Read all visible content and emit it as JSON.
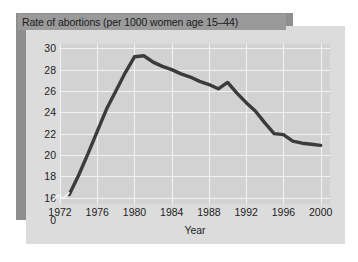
{
  "chart_data": {
    "type": "line",
    "title": "Rate of abortions (per 1000 women age 15–44)",
    "xlabel": "Year",
    "ylabel": "",
    "xlim": [
      1972,
      2001
    ],
    "ylim": [
      15.4,
      30.4
    ],
    "grid": true,
    "legend": false,
    "axis_break": true,
    "xticks": [
      1972,
      1976,
      1980,
      1984,
      1988,
      1992,
      1996,
      2000
    ],
    "xtick_labels": [
      "1972",
      "1976",
      "1980",
      "1984",
      "1988",
      "1992",
      "1996",
      "2000"
    ],
    "yticks": [
      16,
      18,
      20,
      22,
      24,
      26,
      28,
      30
    ],
    "ytick_labels": [
      "16",
      "18",
      "20",
      "22",
      "24",
      "26",
      "28",
      "30"
    ],
    "y_axis_origin_label": "0",
    "series": [
      {
        "name": "Rate of abortions",
        "color": "#3b3b3b",
        "x": [
          1973,
          1974,
          1975,
          1976,
          1977,
          1978,
          1979,
          1980,
          1981,
          1982,
          1983,
          1984,
          1985,
          1986,
          1987,
          1988,
          1989,
          1990,
          1991,
          1992,
          1993,
          1994,
          1995,
          1996,
          1997,
          1998,
          1999,
          2000
        ],
        "values": [
          16.3,
          18.1,
          20.1,
          22.2,
          24.3,
          26.0,
          27.7,
          29.2,
          29.3,
          28.7,
          28.3,
          28.0,
          27.6,
          27.3,
          26.9,
          26.6,
          26.2,
          26.8,
          25.8,
          24.9,
          24.1,
          23.0,
          22.0,
          21.9,
          21.3,
          21.1,
          21.0,
          20.9
        ]
      }
    ]
  },
  "title": {
    "text": "Rate of abortions (per 1000 women age 15–44)"
  },
  "colors": {
    "line": "#3b3b3b",
    "plot_background": "#d2d2d2",
    "panel_background": "#dcdcdc",
    "shadow_band": "#8e8e8e",
    "title_strip": "#9a9a9a",
    "gridline": "#f2f2f2",
    "page_background": "#ffffff"
  }
}
